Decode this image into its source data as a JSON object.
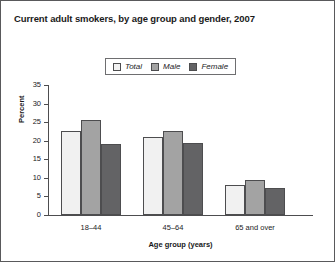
{
  "chart_data": {
    "type": "bar",
    "title": "Current adult smokers, by age group and gender, 2007",
    "xlabel": "Age group (years)",
    "ylabel": "Percent",
    "categories": [
      "18–44",
      "45–64",
      "65 and over"
    ],
    "series": [
      {
        "name": "Total",
        "values": [
          22.5,
          21.0,
          8.2
        ],
        "color": "#f1f1f1"
      },
      {
        "name": "Male",
        "values": [
          25.7,
          22.6,
          9.3
        ],
        "color": "#a3a3a3"
      },
      {
        "name": "Female",
        "values": [
          19.2,
          19.3,
          7.3
        ],
        "color": "#636365"
      }
    ],
    "ylim": [
      0,
      35
    ],
    "yticks": [
      0,
      5,
      10,
      15,
      20,
      25,
      30,
      35
    ],
    "ytick_labels": [
      "0",
      "5",
      "10",
      "15",
      "20",
      "25",
      "30",
      "35"
    ],
    "grid": false,
    "legend_position": "top-center",
    "legend_entries": [
      "Total",
      "Male",
      "Female"
    ]
  },
  "figure": {
    "border_color": "#59595b",
    "background": "#ffffff"
  }
}
